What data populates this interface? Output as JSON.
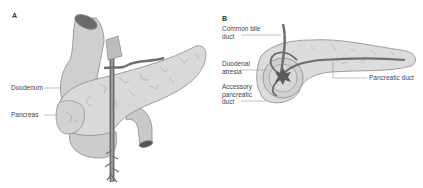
{
  "figure": {
    "panels": [
      {
        "id": "A",
        "letter": "A",
        "labels": {
          "duodenum": "Duodenum",
          "pancreas": "Pancreas"
        }
      },
      {
        "id": "B",
        "letter": "B",
        "labels": {
          "common_bile_duct": "Common bile\nduct",
          "duodenal_atresia": "Duodenal\natresia",
          "accessory_pancreatic_duct": "Accessory\npancreatic\nduct",
          "pancreatic_duct": "Pancreatic duct"
        }
      }
    ],
    "colors": {
      "tissue": "#d6d6d6",
      "tissue_dark": "#a8a8a8",
      "outline": "#8a8a8a",
      "duct": "#6e6e6e",
      "leader": "#999999",
      "text": "#444444"
    }
  }
}
